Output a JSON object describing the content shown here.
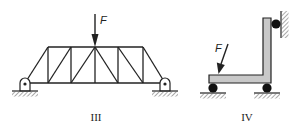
{
  "figures": [
    {
      "id": "III",
      "label": "III",
      "type": "truss",
      "force_label": "F",
      "supports": [
        "pin-left",
        "pin-right"
      ],
      "panels": 6
    },
    {
      "id": "IV",
      "label": "IV",
      "type": "L-shaped-body",
      "force_label": "F",
      "supports": [
        "roller-left-ground",
        "roller-right-ground",
        "roller-wall"
      ]
    }
  ],
  "colors": {
    "line": "#222222",
    "body_fill": "#c8c8c8",
    "hatch": "#555555",
    "background": "#ffffff"
  }
}
